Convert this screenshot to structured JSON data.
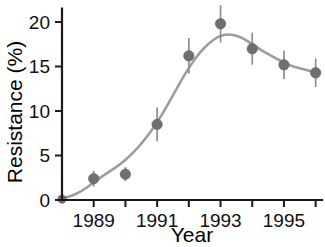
{
  "chart_data": {
    "type": "scatter",
    "title": "",
    "xlabel": "Year",
    "ylabel": "Resistance (%)",
    "x": [
      1988,
      1989,
      1990,
      1991,
      1992,
      1993,
      1994,
      1995,
      1996
    ],
    "values": [
      0.1,
      2.4,
      2.9,
      8.5,
      16.2,
      19.8,
      17.0,
      15.2,
      14.3
    ],
    "errors": [
      0.3,
      0.9,
      0.8,
      1.9,
      2.0,
      2.1,
      1.8,
      1.6,
      1.6
    ],
    "xlim": [
      1988.0,
      1996.2
    ],
    "ylim": [
      0,
      21.5
    ],
    "xticks": [
      1988,
      1989,
      1990,
      1991,
      1992,
      1993,
      1994,
      1995,
      1996
    ],
    "xtick_labels": [
      "",
      "1989",
      "",
      "1991",
      "",
      "1993",
      "",
      "1995",
      ""
    ],
    "yticks": [
      0,
      5,
      10,
      15,
      20
    ],
    "ytick_labels": [
      "0",
      "5",
      "10",
      "15",
      "20"
    ],
    "grid": false,
    "legend": "none",
    "series": [
      {
        "name": "Resistance",
        "marker": "circle",
        "marker_color": "#6f6f6f",
        "fit_line_color": "#9d9d9d",
        "errorbar_color": "#8e8e8e"
      }
    ],
    "fit_curve": [
      [
        1988.0,
        0.15
      ],
      [
        1988.3,
        0.45
      ],
      [
        1988.6,
        0.95
      ],
      [
        1988.9,
        1.7
      ],
      [
        1989.2,
        2.5
      ],
      [
        1989.5,
        3.2
      ],
      [
        1989.8,
        3.9
      ],
      [
        1990.1,
        4.8
      ],
      [
        1990.4,
        5.9
      ],
      [
        1990.7,
        7.2
      ],
      [
        1991.0,
        8.7
      ],
      [
        1991.3,
        10.5
      ],
      [
        1991.6,
        12.4
      ],
      [
        1991.9,
        14.3
      ],
      [
        1992.2,
        15.9
      ],
      [
        1992.5,
        17.2
      ],
      [
        1992.8,
        18.1
      ],
      [
        1993.1,
        18.6
      ],
      [
        1993.4,
        18.6
      ],
      [
        1993.7,
        18.2
      ],
      [
        1994.0,
        17.5
      ],
      [
        1994.3,
        16.8
      ],
      [
        1994.6,
        16.2
      ],
      [
        1994.9,
        15.6
      ],
      [
        1995.2,
        15.1
      ],
      [
        1995.5,
        14.8
      ],
      [
        1995.8,
        14.5
      ],
      [
        1996.1,
        14.3
      ]
    ]
  },
  "colors": {
    "axis": "#1a1a1a",
    "marker": "#6f6f6f",
    "line": "#9d9d9d",
    "errorbar": "#8e8e8e",
    "background": "#ffffff",
    "text": "#111111"
  }
}
